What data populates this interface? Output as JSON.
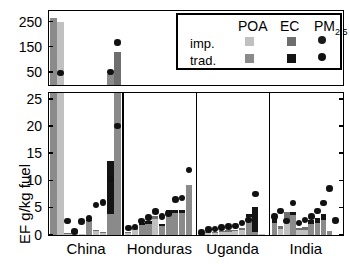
{
  "chart_data": {
    "type": "bar",
    "title": "",
    "xlabel": "",
    "ylabel": "EF g/kg fuel",
    "categories": [
      "China",
      "Honduras",
      "Uganda",
      "India"
    ],
    "panels": [
      {
        "name": "upper-panel",
        "ylim": [
          0,
          290
        ],
        "yticks": [
          50,
          150,
          250
        ],
        "ytick_labels": [
          "50",
          "150",
          "250"
        ],
        "note": "broken axis upper section showing off-scale values"
      },
      {
        "name": "lower-panel",
        "ylim": [
          0,
          26
        ],
        "yticks": [
          0,
          5,
          10,
          15,
          20,
          25
        ],
        "ytick_labels": [
          "0",
          "5",
          "10",
          "15",
          "20",
          "25"
        ]
      }
    ],
    "legend": {
      "position": "top-right-inset",
      "column_headers": [
        "POA",
        "EC",
        "PM"
      ],
      "pm_subscript": "2.5",
      "row_labels": [
        "imp.",
        "trad."
      ],
      "entries": [
        {
          "row": "imp.",
          "series": "POA",
          "color": "#c0c0c0"
        },
        {
          "row": "imp.",
          "series": "EC",
          "color": "#6e6e6e"
        },
        {
          "row": "imp.",
          "series": "PM2.5",
          "color": "#1a1a1a"
        },
        {
          "row": "trad.",
          "series": "POA",
          "color": "#8a8a8a"
        },
        {
          "row": "trad.",
          "series": "EC",
          "color": "#141414"
        },
        {
          "row": "trad.",
          "series": "PM2.5",
          "color": "#111111"
        }
      ]
    },
    "colors": {
      "poa_improved": "#c0c0c0",
      "poa_traditional": "#8a8a8a",
      "ec_improved": "#6e6e6e",
      "ec_traditional": "#141414",
      "pm25_marker": "#111111",
      "frame": "#000000",
      "background": "#ffffff"
    },
    "groups": [
      {
        "name": "China",
        "bars": [
          {
            "id": "cn-1",
            "stove": "trad.",
            "poa": 26.5,
            "ec": 0.0,
            "pm25": null,
            "clipped": true
          },
          {
            "id": "cn-2",
            "stove": "imp.",
            "poa": 250.0,
            "ec": 0.0,
            "pm25": 47.0,
            "clipped": true
          },
          {
            "id": "cn-3",
            "stove": "imp.",
            "poa": 0.2,
            "ec": 0.15,
            "pm25": 2.6
          },
          {
            "id": "cn-4",
            "stove": "imp.",
            "poa": 0.75,
            "ec": 0.2,
            "pm25": 0.6
          },
          {
            "id": "cn-5",
            "stove": "imp.",
            "poa": 0.2,
            "ec": 0.05,
            "pm25": 2.5
          },
          {
            "id": "cn-6",
            "stove": "trad.",
            "poa": 2.6,
            "ec": 0.25,
            "pm25": 3.0
          },
          {
            "id": "cn-7",
            "stove": "imp.",
            "poa": 0.9,
            "ec": 0.1,
            "pm25": 5.5
          },
          {
            "id": "cn-8",
            "stove": "imp.",
            "poa": 0.55,
            "ec": 0.1,
            "pm25": 6.0
          },
          {
            "id": "cn-9",
            "stove": "trad.",
            "poa": 3.8,
            "ec": 9.8,
            "pm25": 10.3
          },
          {
            "id": "cn-10",
            "stove": "trad.",
            "poa": 130.0,
            "ec": 0.0,
            "pm25": 20.1,
            "clipped": true
          }
        ]
      },
      {
        "name": "Honduras",
        "bars": [
          {
            "id": "hn-1",
            "stove": "imp.",
            "poa": 0.45,
            "ec": 0.15,
            "pm25": 1.3
          },
          {
            "id": "hn-2",
            "stove": "imp.",
            "poa": 0.9,
            "ec": 0.35,
            "pm25": 1.5
          },
          {
            "id": "hn-3",
            "stove": "trad.",
            "poa": 1.9,
            "ec": 0.35,
            "pm25": 2.6
          },
          {
            "id": "hn-4",
            "stove": "trad.",
            "poa": 2.0,
            "ec": 0.6,
            "pm25": 3.2
          },
          {
            "id": "hn-5",
            "stove": "imp.",
            "poa": 2.9,
            "ec": 0.6,
            "pm25": 4.3
          },
          {
            "id": "hn-6",
            "stove": "trad.",
            "poa": 1.6,
            "ec": 0.5,
            "pm25": 3.4
          },
          {
            "id": "hn-7",
            "stove": "trad.",
            "poa": 3.6,
            "ec": 1.1,
            "pm25": 4.0
          },
          {
            "id": "hn-8",
            "stove": "trad.",
            "poa": 4.0,
            "ec": 0.7,
            "pm25": 6.6
          },
          {
            "id": "hn-9",
            "stove": "trad.",
            "poa": 4.0,
            "ec": 0.55,
            "pm25": 6.8
          },
          {
            "id": "hn-10",
            "stove": "trad.",
            "poa": 9.3,
            "ec": 0.0,
            "pm25": 12.0
          }
        ]
      },
      {
        "name": "Uganda",
        "bars": [
          {
            "id": "ug-1",
            "stove": "imp.",
            "poa": 0.15,
            "ec": 0.1,
            "pm25": 0.5
          },
          {
            "id": "ug-2",
            "stove": "imp.",
            "poa": 0.3,
            "ec": 0.2,
            "pm25": 1.0
          },
          {
            "id": "ug-3",
            "stove": "imp.",
            "poa": 0.4,
            "ec": 0.2,
            "pm25": 1.1
          },
          {
            "id": "ug-4",
            "stove": "imp.",
            "poa": 0.5,
            "ec": 0.25,
            "pm25": 1.4
          },
          {
            "id": "ug-5",
            "stove": "imp.",
            "poa": 0.6,
            "ec": 0.3,
            "pm25": 1.6
          },
          {
            "id": "ug-6",
            "stove": "imp.",
            "poa": 0.7,
            "ec": 0.3,
            "pm25": 1.7
          },
          {
            "id": "ug-7",
            "stove": "imp.",
            "poa": 1.0,
            "ec": 0.35,
            "pm25": 2.2
          },
          {
            "id": "ug-8",
            "stove": "trad.",
            "poa": 3.3,
            "ec": 0.5,
            "pm25": 2.8
          },
          {
            "id": "ug-9",
            "stove": "trad.",
            "poa": 0.5,
            "ec": 4.6,
            "pm25": 7.6
          },
          {
            "id": "ug-10",
            "stove": "imp.",
            "poa": 0.2,
            "ec": 0.0,
            "pm25": null
          }
        ]
      },
      {
        "name": "India",
        "bars": [
          {
            "id": "in-1",
            "stove": "trad.",
            "poa": 2.2,
            "ec": 1.0,
            "pm25": 3.4
          },
          {
            "id": "in-2",
            "stove": "imp.",
            "poa": 1.2,
            "ec": 0.4,
            "pm25": 4.4
          },
          {
            "id": "in-3",
            "stove": "imp.",
            "poa": 2.5,
            "ec": 1.7,
            "pm25": 2.6
          },
          {
            "id": "in-4",
            "stove": "trad.",
            "poa": 3.6,
            "ec": 0.6,
            "pm25": 5.9
          },
          {
            "id": "in-5",
            "stove": "imp.",
            "poa": 0.9,
            "ec": 0.35,
            "pm25": 2.2
          },
          {
            "id": "in-6",
            "stove": "imp.",
            "poa": 1.0,
            "ec": 0.4,
            "pm25": 2.8
          },
          {
            "id": "in-7",
            "stove": "trad.",
            "poa": 2.1,
            "ec": 0.7,
            "pm25": 3.4
          },
          {
            "id": "in-8",
            "stove": "trad.",
            "poa": 2.3,
            "ec": 0.8,
            "pm25": 4.4
          },
          {
            "id": "in-9",
            "stove": "trad.",
            "poa": 2.8,
            "ec": 1.1,
            "pm25": 5.9
          },
          {
            "id": "in-10",
            "stove": "trad.",
            "poa": 0.8,
            "ec": 0.0,
            "pm25": 8.6
          },
          {
            "id": "in-11",
            "stove": "trad.",
            "poa": 0.0,
            "ec": 0.0,
            "pm25": 2.7
          }
        ]
      }
    ],
    "upper_panel_points": [
      {
        "id": "cn-2-bar",
        "value": 250.0,
        "kind": "bar",
        "color": "#c0c0c0"
      },
      {
        "id": "cn-1-bar",
        "value": 265.0,
        "kind": "bar",
        "color": "#8a8a8a"
      },
      {
        "id": "cn-2-pm",
        "value": 47.0,
        "kind": "marker"
      },
      {
        "id": "cn-10-bar",
        "value": 130.0,
        "kind": "bar",
        "color": "#6e6e6e"
      },
      {
        "id": "cn-10-pm",
        "value": 168.0,
        "kind": "marker"
      },
      {
        "id": "cn-9-pm",
        "value": 52.0,
        "kind": "marker"
      },
      {
        "id": "cn-9-poa",
        "value": 45.0,
        "kind": "bar",
        "color": "#8a8a8a"
      }
    ]
  }
}
